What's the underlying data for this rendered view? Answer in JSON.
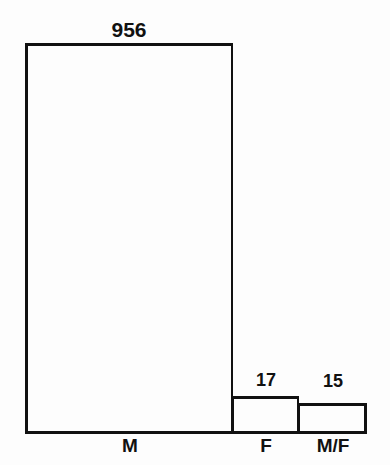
{
  "chart_data": {
    "type": "bar",
    "title": "",
    "subtitle": "",
    "xlabel": "",
    "ylabel": "",
    "categories": [
      "M",
      "F",
      "M/F"
    ],
    "values": [
      956,
      17,
      15
    ],
    "value_labels": [
      "956",
      "17",
      "15"
    ],
    "series": [
      {
        "name": "count",
        "values": [
          956,
          17,
          15
        ]
      }
    ],
    "ylim": [
      0,
      956
    ],
    "grid": false,
    "legend": null,
    "axis": {
      "baseline_visible": true,
      "y_axis_ticks": [],
      "x_axis_ticks": [
        "M",
        "F",
        "M/F"
      ]
    },
    "annotations": [],
    "style": {
      "bar_fill": "#ffffff",
      "bar_stroke": "#111111",
      "background": "#fdfdfd",
      "text_color": "#111111"
    }
  },
  "bars": [
    {
      "category": "M",
      "value_label": "956"
    },
    {
      "category": "F",
      "value_label": "17"
    },
    {
      "category": "M/F",
      "value_label": "15"
    }
  ]
}
